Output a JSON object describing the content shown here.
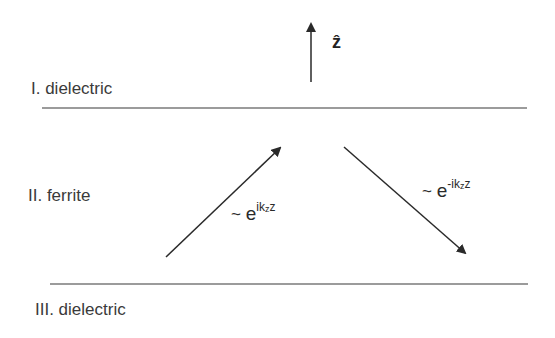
{
  "diagram": {
    "axis_label": "ẑ",
    "regions": [
      {
        "id": "I",
        "label": "I. dielectric"
      },
      {
        "id": "II",
        "label": "II. ferrite"
      },
      {
        "id": "III",
        "label": "III. dielectric"
      }
    ],
    "waves": {
      "incident": {
        "tilde": "~",
        "base": "e",
        "exp_pre": "ik",
        "exp_sub": "z",
        "exp_post": "z"
      },
      "reflected": {
        "tilde": "~",
        "base": "e",
        "exp_pre": "-ik",
        "exp_sub": "z",
        "exp_post": "z"
      }
    },
    "colors": {
      "lines": "#7a7a7a",
      "arrows": "#333333",
      "text": "#3a3a3a"
    }
  }
}
